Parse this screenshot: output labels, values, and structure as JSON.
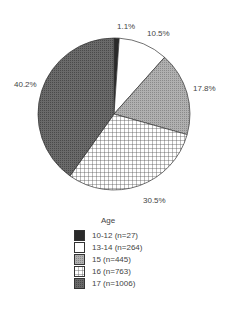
{
  "chart_data": {
    "type": "pie",
    "title": "",
    "legend_title": "Age",
    "legend_position": "bottom",
    "categories": [
      "10-12 (n=27)",
      "13-14 (n=264)",
      "15 (n=445)",
      "16 (n=763)",
      "17 (n=1006)"
    ],
    "values": [
      1.1,
      10.5,
      17.8,
      30.5,
      40.2
    ],
    "counts": [
      27,
      264,
      445,
      763,
      1006
    ],
    "value_labels": [
      "1.1%",
      "10.5%",
      "17.8%",
      "30.5%",
      "40.2%"
    ],
    "start_angle_deg": 0,
    "direction": "clockwise",
    "fills": [
      {
        "pattern": "dark-solid",
        "color": "#2a2a2a"
      },
      {
        "pattern": "white",
        "color": "#ffffff"
      },
      {
        "pattern": "light-gray-stipple",
        "color": "#a0a0a0"
      },
      {
        "pattern": "crosshatch-grid",
        "color": "#ffffff",
        "line_color": "#444444"
      },
      {
        "pattern": "dark-gray-stipple",
        "color": "#5e5e5e"
      }
    ]
  },
  "labels": {
    "s0": "1.1%",
    "s1": "10.5%",
    "s2": "17.8%",
    "s3": "30.5%",
    "s4": "40.2%"
  },
  "legend": {
    "title": "Age",
    "items": [
      {
        "label": "10-12 (n=27)"
      },
      {
        "label": "13-14 (n=264)"
      },
      {
        "label": "15 (n=445)"
      },
      {
        "label": "16 (n=763)"
      },
      {
        "label": "17 (n=1006)"
      }
    ]
  }
}
